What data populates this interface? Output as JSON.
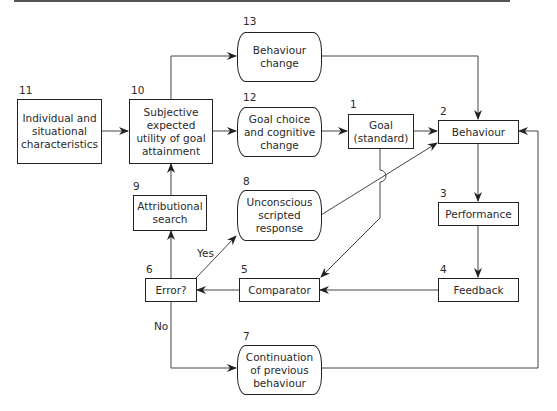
{
  "diagram": {
    "nodes": [
      {
        "id": "1",
        "number": "1",
        "label": "Goal\n(standard)",
        "shape": "rect"
      },
      {
        "id": "2",
        "number": "2",
        "label": "Behaviour",
        "shape": "rect"
      },
      {
        "id": "3",
        "number": "3",
        "label": "Performance",
        "shape": "rect"
      },
      {
        "id": "4",
        "number": "4",
        "label": "Feedback",
        "shape": "rect"
      },
      {
        "id": "5",
        "number": "5",
        "label": "Comparator",
        "shape": "rect"
      },
      {
        "id": "6",
        "number": "6",
        "label": "Error?",
        "shape": "rect"
      },
      {
        "id": "7",
        "number": "7",
        "label": "Continuation\nof previous\nbehaviour",
        "shape": "rounded"
      },
      {
        "id": "8",
        "number": "8",
        "label": "Unconscious\nscripted\nresponse",
        "shape": "rounded"
      },
      {
        "id": "9",
        "number": "9",
        "label": "Attributional\nsearch",
        "shape": "rect"
      },
      {
        "id": "10",
        "number": "10",
        "label": "Subjective\nexpected\nutility of goal\nattainment",
        "shape": "rect"
      },
      {
        "id": "11",
        "number": "11",
        "label": "Individual and\nsituational\ncharacteristics",
        "shape": "rect"
      },
      {
        "id": "12",
        "number": "12",
        "label": "Goal choice\nand cognitive\nchange",
        "shape": "rounded"
      },
      {
        "id": "13",
        "number": "13",
        "label": "Behaviour\nchange",
        "shape": "rounded"
      }
    ],
    "edge_labels": {
      "yes": "Yes",
      "no": "No"
    },
    "edges": [
      {
        "from": "11",
        "to": "10"
      },
      {
        "from": "10",
        "to": "12"
      },
      {
        "from": "10",
        "to": "13"
      },
      {
        "from": "12",
        "to": "1"
      },
      {
        "from": "1",
        "to": "2"
      },
      {
        "from": "13",
        "to": "2"
      },
      {
        "from": "8",
        "to": "2"
      },
      {
        "from": "2",
        "to": "3"
      },
      {
        "from": "3",
        "to": "4"
      },
      {
        "from": "4",
        "to": "5"
      },
      {
        "from": "1",
        "to": "5"
      },
      {
        "from": "5",
        "to": "6"
      },
      {
        "from": "6",
        "to": "8",
        "label": "Yes"
      },
      {
        "from": "6",
        "to": "9"
      },
      {
        "from": "9",
        "to": "10"
      },
      {
        "from": "6",
        "to": "7",
        "label": "No"
      },
      {
        "from": "7",
        "to": "2"
      }
    ],
    "colors": {
      "line": "#222222",
      "box_border": "#222222",
      "background": "#ffffff"
    }
  }
}
